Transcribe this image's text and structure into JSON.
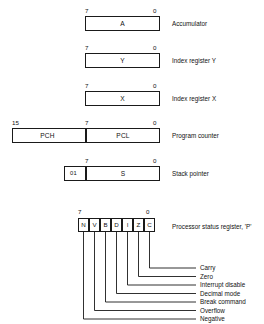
{
  "diagram": {
    "registers": [
      {
        "id": "accumulator",
        "cells": [
          {
            "name": "A"
          }
        ],
        "bit_high": "7",
        "bit_low": "0",
        "label": "Accumulator"
      },
      {
        "id": "index-y",
        "cells": [
          {
            "name": "Y"
          }
        ],
        "bit_high": "7",
        "bit_low": "0",
        "label": "Index register Y"
      },
      {
        "id": "index-x",
        "cells": [
          {
            "name": "X"
          }
        ],
        "bit_high": "7",
        "bit_low": "0",
        "label": "Index register X"
      },
      {
        "id": "program-counter",
        "cells": [
          {
            "name": "PCH"
          },
          {
            "name": "PCL"
          }
        ],
        "bit_high": "15",
        "bit_mid": "7",
        "bit_low": "0",
        "label": "Program counter"
      },
      {
        "id": "stack-pointer",
        "cells": [
          {
            "name": "01"
          },
          {
            "name": "S"
          }
        ],
        "bit_high": "7",
        "bit_low": "0",
        "label": "Stack pointer"
      }
    ],
    "status_register": {
      "id": "processor-status",
      "bit_high": "7",
      "bit_low": "0",
      "label": "Processor status register,  'P'",
      "bits": [
        {
          "symbol": "N",
          "flag": "Negative"
        },
        {
          "symbol": "V",
          "flag": "Overflow"
        },
        {
          "symbol": "B",
          "flag": "Break command"
        },
        {
          "symbol": "D",
          "flag": "Decimal mode"
        },
        {
          "symbol": "I",
          "flag": "Interrupt disable"
        },
        {
          "symbol": "Z",
          "flag": "Zero"
        },
        {
          "symbol": "C",
          "flag": "Carry"
        }
      ],
      "flag_callouts": [
        "Carry",
        "Zero",
        "Interrupt disable",
        "Decimal mode",
        "Break command",
        "Overflow",
        "Negative"
      ]
    },
    "colors": {
      "ink": "#1a1a1a",
      "paper": "#ffffff"
    }
  }
}
